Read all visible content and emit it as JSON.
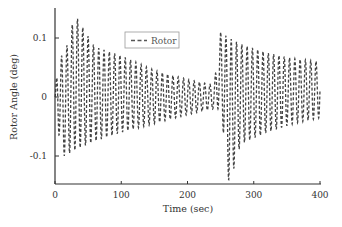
{
  "chart_data": {
    "type": "line",
    "title": "",
    "xlabel": "Time (sec)",
    "ylabel": "Rotor Angle (deg)",
    "xlim": [
      0,
      400
    ],
    "ylim": [
      -0.15,
      0.15
    ],
    "xticks": [
      0,
      100,
      200,
      300,
      400
    ],
    "xtick_labels": [
      "0",
      "100",
      "200",
      "300",
      "400"
    ],
    "yticks": [
      0.1,
      0,
      -0.1
    ],
    "ytick_labels": [
      "0.1",
      "0",
      "-0.1"
    ],
    "grid": false,
    "legend_position": "upper-center",
    "series": [
      {
        "name": "Rotor",
        "style": "dashed",
        "color": "#444444",
        "oscillation_period_sec": 8,
        "envelope": [
          {
            "t": 0,
            "upper": 0.0,
            "lower": 0.0
          },
          {
            "t": 5,
            "upper": 0.07,
            "lower": -0.06
          },
          {
            "t": 14,
            "upper": 0.07,
            "lower": -0.1
          },
          {
            "t": 30,
            "upper": 0.14,
            "lower": -0.09
          },
          {
            "t": 60,
            "upper": 0.085,
            "lower": -0.075
          },
          {
            "t": 100,
            "upper": 0.07,
            "lower": -0.06
          },
          {
            "t": 150,
            "upper": 0.045,
            "lower": -0.045
          },
          {
            "t": 200,
            "upper": 0.03,
            "lower": -0.03
          },
          {
            "t": 240,
            "upper": 0.02,
            "lower": -0.02
          },
          {
            "t": 250,
            "upper": 0.11,
            "lower": -0.02
          },
          {
            "t": 263,
            "upper": 0.1,
            "lower": -0.15
          },
          {
            "t": 280,
            "upper": 0.09,
            "lower": -0.08
          },
          {
            "t": 320,
            "upper": 0.075,
            "lower": -0.06
          },
          {
            "t": 360,
            "upper": 0.065,
            "lower": -0.045
          },
          {
            "t": 400,
            "upper": 0.06,
            "lower": -0.035
          }
        ]
      }
    ]
  },
  "legend": {
    "items": [
      {
        "label": "Rotor",
        "style": "dashed"
      }
    ]
  }
}
